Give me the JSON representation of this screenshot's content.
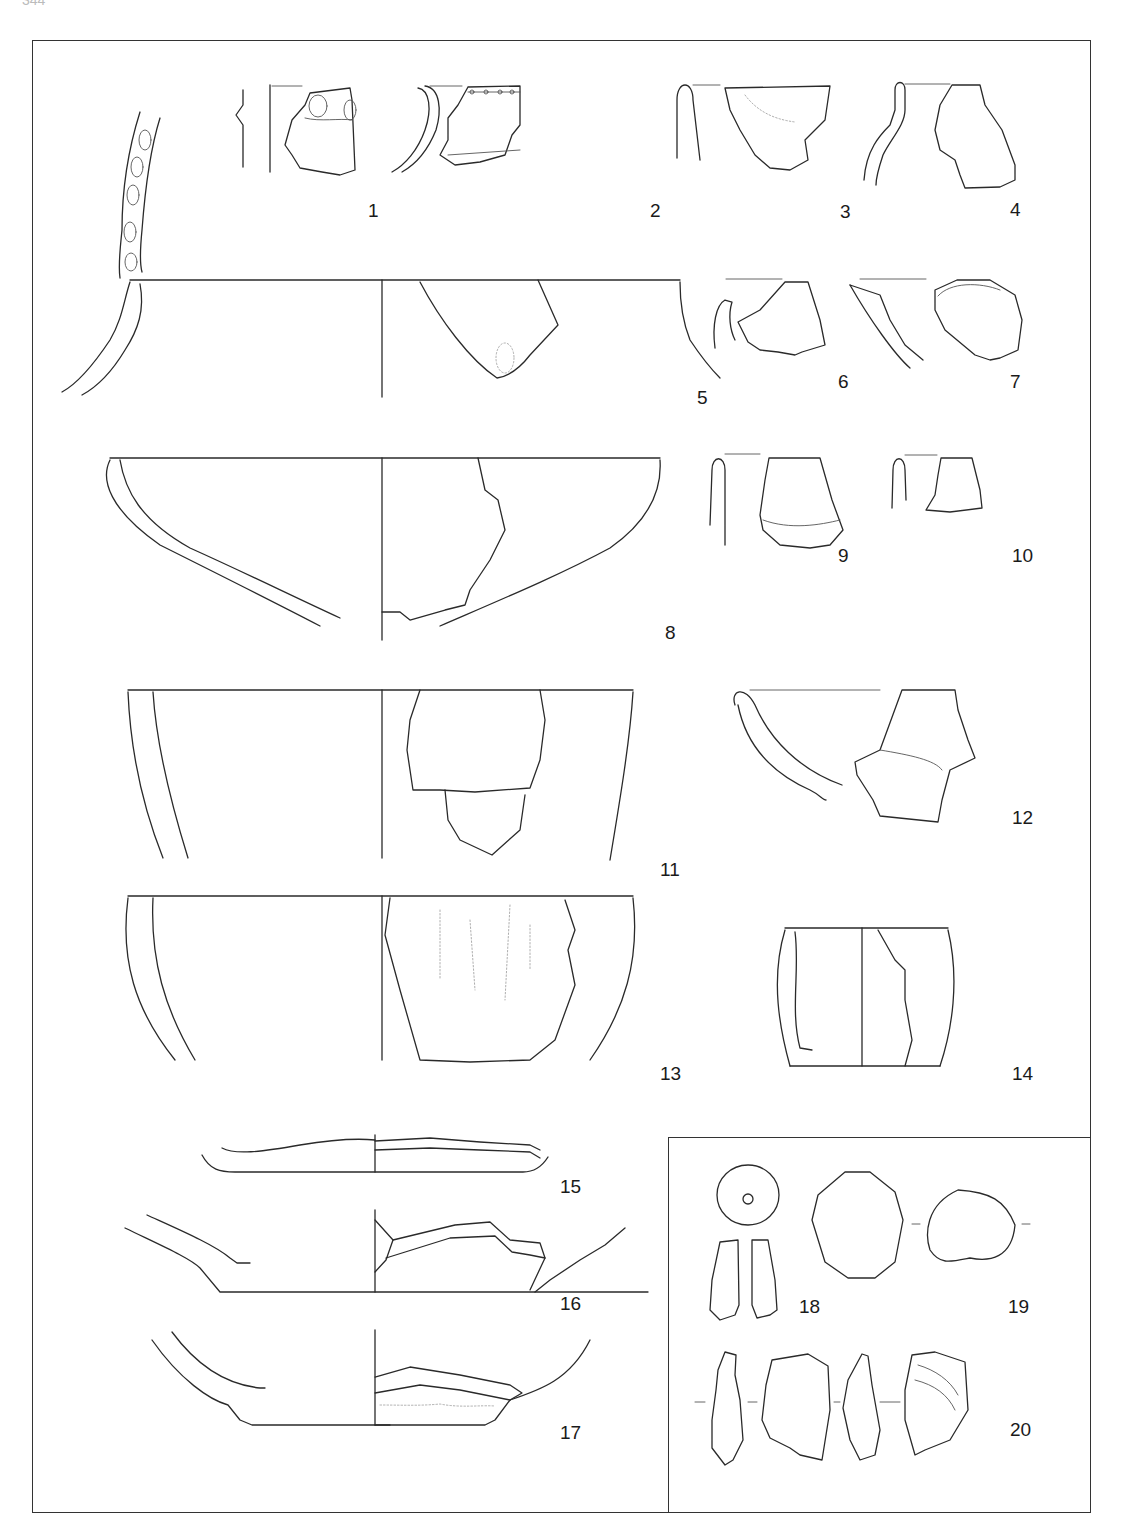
{
  "page": {
    "number": "344"
  },
  "figure": {
    "type": "archaeological finds plate",
    "items": [
      {
        "id": "1",
        "label": "1",
        "desc": "rim sherd with impressed decoration"
      },
      {
        "id": "2",
        "label": "2",
        "desc": "rim sherd with perforations below rim"
      },
      {
        "id": "3",
        "label": "3",
        "desc": "rim sherd"
      },
      {
        "id": "4",
        "label": "4",
        "desc": "neck sherd"
      },
      {
        "id": "5",
        "label": "5",
        "desc": "large jar rim with impressed band"
      },
      {
        "id": "6",
        "label": "6",
        "desc": "rim sherd"
      },
      {
        "id": "7",
        "label": "7",
        "desc": "rim sherd"
      },
      {
        "id": "8",
        "label": "8",
        "desc": "open bowl"
      },
      {
        "id": "9",
        "label": "9",
        "desc": "rim sherd"
      },
      {
        "id": "10",
        "label": "10",
        "desc": "rim sherd"
      },
      {
        "id": "11",
        "label": "11",
        "desc": "deep vessel"
      },
      {
        "id": "12",
        "label": "12",
        "desc": "bowl sherd"
      },
      {
        "id": "13",
        "label": "13",
        "desc": "deep vessel with scratched surface"
      },
      {
        "id": "14",
        "label": "14",
        "desc": "small cylindrical cup"
      },
      {
        "id": "15",
        "label": "15",
        "desc": "base"
      },
      {
        "id": "16",
        "label": "16",
        "desc": "base"
      },
      {
        "id": "17",
        "label": "17",
        "desc": "base"
      },
      {
        "id": "18",
        "label": "18",
        "desc": "spindle whorl / bead"
      },
      {
        "id": "19",
        "label": "19",
        "desc": "stone object"
      },
      {
        "id": "20",
        "label": "20",
        "desc": "lithic flakes"
      }
    ]
  }
}
